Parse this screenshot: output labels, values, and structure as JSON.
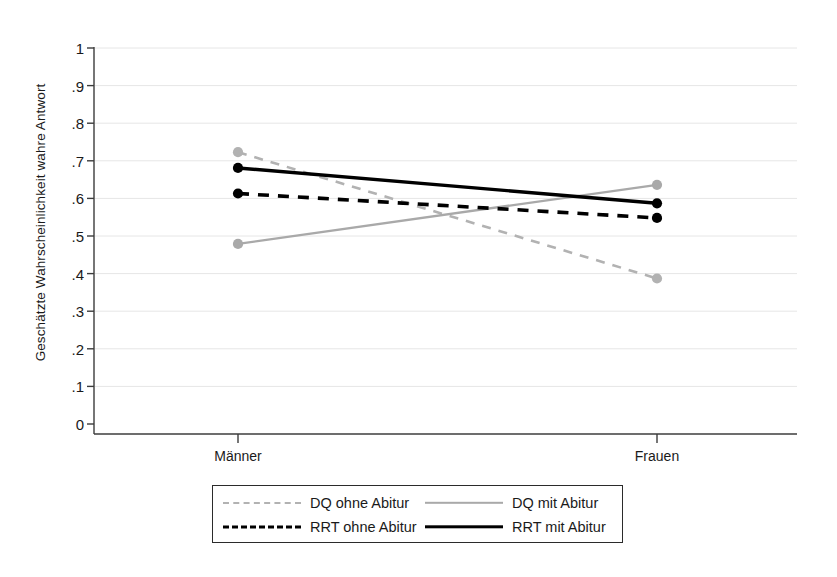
{
  "chart_data": {
    "type": "line",
    "title": "",
    "xlabel": "",
    "ylabel": "Geschätzte Wahrscheinlichkeit wahre Antwort",
    "categories": [
      "Männer",
      "Frauen"
    ],
    "ylim": [
      0,
      1
    ],
    "ytick_labels": [
      "0",
      ".1",
      ".2",
      ".3",
      ".4",
      ".5",
      ".6",
      ".7",
      ".8",
      ".9",
      "1"
    ],
    "ytick_values": [
      0,
      0.1,
      0.2,
      0.3,
      0.4,
      0.5,
      0.6,
      0.7,
      0.8,
      0.9,
      1
    ],
    "grid": "horizontal",
    "legend_position": "bottom",
    "series": [
      {
        "name": "DQ ohne Abitur",
        "values": [
          0.723,
          0.387
        ],
        "color": "#b2b2b2",
        "style": "dashed",
        "width": 2.6,
        "marker": true
      },
      {
        "name": "DQ mit Abitur",
        "values": [
          0.479,
          0.636
        ],
        "color": "#a9a9a9",
        "style": "solid",
        "width": 2.4,
        "marker": true
      },
      {
        "name": "RRT ohne Abitur",
        "values": [
          0.613,
          0.548
        ],
        "color": "#000000",
        "style": "dashed",
        "width": 3.6,
        "marker": true
      },
      {
        "name": "RRT mit Abitur",
        "values": [
          0.681,
          0.587
        ],
        "color": "#000000",
        "style": "solid",
        "width": 3.4,
        "marker": true
      }
    ]
  },
  "legend": {
    "entries": [
      {
        "label": "DQ ohne Abitur",
        "swatch": "sw-dash-gray"
      },
      {
        "label": "DQ mit Abitur",
        "swatch": "sw-solid-gray"
      },
      {
        "label": "RRT ohne Abitur",
        "swatch": "sw-dash-black"
      },
      {
        "label": "RRT mit Abitur",
        "swatch": "sw-solid-black"
      }
    ]
  },
  "axes": {
    "axis_color": "#3c3c3c",
    "grid_color": "#e6e6e6"
  }
}
